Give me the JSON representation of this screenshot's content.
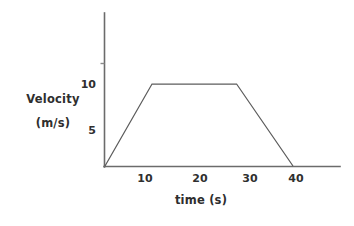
{
  "chart_data": {
    "type": "line",
    "title": "",
    "subtitle": "",
    "xlabel": "time (s)",
    "ylabel_line1": "Velocity",
    "ylabel_line2": "(m/s)",
    "xlabel_full": "time (s)",
    "ylabel_full": "Velocity (m/s)",
    "x": [
      0,
      10,
      28,
      40
    ],
    "values": [
      0,
      10,
      10,
      0
    ],
    "series": [
      {
        "name": "velocity",
        "x": [
          0,
          10,
          28,
          40
        ],
        "values": [
          0,
          10,
          10,
          0
        ]
      }
    ],
    "xticks": [
      10,
      20,
      30,
      40
    ],
    "xtick_labels": [
      "10",
      "20",
      "30",
      "40"
    ],
    "yticks": [
      5,
      10
    ],
    "ytick_labels": [
      "5",
      "10"
    ],
    "xlim": [
      0,
      48
    ],
    "ylim": [
      0,
      16
    ],
    "grid": false,
    "legend": false,
    "legend_position": "none",
    "annotations": [],
    "line_color": "#5c5c5c",
    "axis_color": "#6b6b6b",
    "background_color": "#ffffff"
  },
  "axes": {
    "x_axis_name": "time-axis",
    "y_axis_name": "velocity-axis"
  }
}
